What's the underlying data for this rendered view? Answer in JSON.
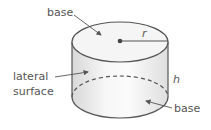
{
  "labels": {
    "top_base": "base",
    "radius": "r",
    "lateral_line1": "lateral",
    "lateral_line2": "surface",
    "height": "h",
    "bottom_base": "base"
  },
  "colors": {
    "outline": "#555555",
    "top_face": "#f4f4f4",
    "side_light": "#fafafa",
    "side_shade": "#dcdcdc",
    "text": "#555555"
  }
}
